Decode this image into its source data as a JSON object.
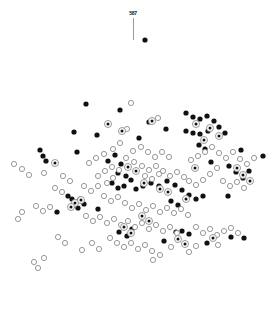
{
  "figure": {
    "width": 272,
    "height": 314,
    "background": "#ffffff"
  },
  "annotation": {
    "label": "587",
    "label_x": 133,
    "label_y": 10,
    "leader_x": 133,
    "leader_y_top": 18,
    "leader_y_bottom": 40,
    "leader_color": "#9a9a9a"
  },
  "markers": {
    "filled_color": "#111111",
    "hollow_stroke": "#8d8d8d",
    "hollow_fill": "#ffffff",
    "bullseye_stroke": "#8d8d8d",
    "bullseye_core": "#111111",
    "radius": 2.6
  },
  "chart_data": {
    "type": "scatter",
    "title": "",
    "subtitle": "",
    "xlabel": "",
    "ylabel": "",
    "xlim": [
      0,
      272
    ],
    "ylim": [
      314,
      0
    ],
    "grid": false,
    "axes_visible": false,
    "legend": null,
    "legend_position": "none",
    "annotations": [
      {
        "text": "587",
        "x": 133,
        "y": 10,
        "points_to_x": 145,
        "points_to_y": 40
      }
    ],
    "series": [
      {
        "name": "filled",
        "marker": "filled-circle",
        "color": "#111111",
        "points": [
          [
            145,
            40
          ],
          [
            86,
            104
          ],
          [
            120,
            110
          ],
          [
            149,
            122
          ],
          [
            74,
            132
          ],
          [
            97,
            135
          ],
          [
            139,
            138
          ],
          [
            186,
            113
          ],
          [
            193,
            117
          ],
          [
            200,
            119
          ],
          [
            207,
            116
          ],
          [
            214,
            121
          ],
          [
            219,
            127
          ],
          [
            208,
            131
          ],
          [
            200,
            134
          ],
          [
            193,
            133
          ],
          [
            186,
            131
          ],
          [
            225,
            133
          ],
          [
            199,
            145
          ],
          [
            205,
            149
          ],
          [
            241,
            150
          ],
          [
            211,
            162
          ],
          [
            77,
            152
          ],
          [
            40,
            150
          ],
          [
            43,
            156
          ],
          [
            46,
            161
          ],
          [
            166,
            129
          ],
          [
            115,
            155
          ],
          [
            108,
            161
          ],
          [
            121,
            164
          ],
          [
            118,
            173
          ],
          [
            126,
            176
          ],
          [
            131,
            180
          ],
          [
            124,
            186
          ],
          [
            118,
            188
          ],
          [
            112,
            183
          ],
          [
            136,
            189
          ],
          [
            143,
            186
          ],
          [
            151,
            183
          ],
          [
            159,
            186
          ],
          [
            167,
            181
          ],
          [
            175,
            185
          ],
          [
            182,
            190
          ],
          [
            189,
            195
          ],
          [
            196,
            199
          ],
          [
            203,
            196
          ],
          [
            68,
            196
          ],
          [
            72,
            199
          ],
          [
            76,
            202
          ],
          [
            80,
            199
          ],
          [
            84,
            204
          ],
          [
            78,
            208
          ],
          [
            72,
            206
          ],
          [
            98,
            209
          ],
          [
            57,
            212
          ],
          [
            229,
            166
          ],
          [
            236,
            172
          ],
          [
            243,
            178
          ],
          [
            249,
            171
          ],
          [
            263,
            156
          ],
          [
            228,
            196
          ],
          [
            171,
            201
          ],
          [
            178,
            205
          ],
          [
            119,
            232
          ],
          [
            132,
            229
          ],
          [
            127,
            236
          ],
          [
            164,
            241
          ],
          [
            176,
            232
          ],
          [
            182,
            231
          ],
          [
            189,
            234
          ],
          [
            231,
            237
          ],
          [
            244,
            238
          ],
          [
            207,
            243
          ]
        ]
      },
      {
        "name": "hollow",
        "marker": "open-circle",
        "color": "#8d8d8d",
        "points": [
          [
            131,
            103
          ],
          [
            158,
            118
          ],
          [
            127,
            129
          ],
          [
            120,
            143
          ],
          [
            113,
            149
          ],
          [
            133,
            151
          ],
          [
            141,
            147
          ],
          [
            148,
            152
          ],
          [
            155,
            157
          ],
          [
            162,
            152
          ],
          [
            169,
            157
          ],
          [
            104,
            154
          ],
          [
            96,
            158
          ],
          [
            89,
            163
          ],
          [
            126,
            158
          ],
          [
            134,
            162
          ],
          [
            142,
            166
          ],
          [
            149,
            170
          ],
          [
            156,
            166
          ],
          [
            163,
            171
          ],
          [
            170,
            176
          ],
          [
            177,
            172
          ],
          [
            184,
            177
          ],
          [
            112,
            167
          ],
          [
            105,
            171
          ],
          [
            98,
            176
          ],
          [
            119,
            170
          ],
          [
            113,
            178
          ],
          [
            107,
            183
          ],
          [
            145,
            176
          ],
          [
            152,
            179
          ],
          [
            159,
            174
          ],
          [
            191,
            160
          ],
          [
            198,
            156
          ],
          [
            205,
            152
          ],
          [
            212,
            147
          ],
          [
            219,
            153
          ],
          [
            226,
            158
          ],
          [
            233,
            152
          ],
          [
            240,
            159
          ],
          [
            247,
            164
          ],
          [
            254,
            158
          ],
          [
            217,
            168
          ],
          [
            210,
            174
          ],
          [
            203,
            180
          ],
          [
            196,
            185
          ],
          [
            189,
            181
          ],
          [
            223,
            181
          ],
          [
            230,
            186
          ],
          [
            237,
            182
          ],
          [
            244,
            188
          ],
          [
            14,
            164
          ],
          [
            22,
            169
          ],
          [
            29,
            175
          ],
          [
            44,
            173
          ],
          [
            63,
            176
          ],
          [
            70,
            181
          ],
          [
            84,
            186
          ],
          [
            91,
            191
          ],
          [
            98,
            186
          ],
          [
            55,
            188
          ],
          [
            62,
            192
          ],
          [
            104,
            196
          ],
          [
            111,
            201
          ],
          [
            118,
            197
          ],
          [
            125,
            203
          ],
          [
            132,
            208
          ],
          [
            139,
            204
          ],
          [
            146,
            210
          ],
          [
            153,
            206
          ],
          [
            160,
            212
          ],
          [
            167,
            208
          ],
          [
            174,
            213
          ],
          [
            181,
            209
          ],
          [
            188,
            215
          ],
          [
            22,
            212
          ],
          [
            36,
            206
          ],
          [
            43,
            211
          ],
          [
            50,
            207
          ],
          [
            18,
            219
          ],
          [
            86,
            216
          ],
          [
            93,
            221
          ],
          [
            100,
            217
          ],
          [
            107,
            223
          ],
          [
            114,
            219
          ],
          [
            121,
            225
          ],
          [
            128,
            221
          ],
          [
            135,
            227
          ],
          [
            142,
            223
          ],
          [
            149,
            229
          ],
          [
            156,
            225
          ],
          [
            163,
            231
          ],
          [
            170,
            227
          ],
          [
            177,
            233
          ],
          [
            196,
            227
          ],
          [
            203,
            233
          ],
          [
            210,
            229
          ],
          [
            217,
            235
          ],
          [
            224,
            231
          ],
          [
            231,
            228
          ],
          [
            238,
            233
          ],
          [
            110,
            238
          ],
          [
            117,
            243
          ],
          [
            124,
            247
          ],
          [
            131,
            243
          ],
          [
            138,
            249
          ],
          [
            145,
            245
          ],
          [
            152,
            251
          ],
          [
            92,
            243
          ],
          [
            99,
            249
          ],
          [
            82,
            250
          ],
          [
            34,
            262
          ],
          [
            38,
            268
          ],
          [
            44,
            258
          ],
          [
            171,
            247
          ],
          [
            196,
            246
          ],
          [
            189,
            252
          ],
          [
            160,
            255
          ],
          [
            153,
            260
          ],
          [
            218,
            245
          ],
          [
            58,
            237
          ],
          [
            65,
            243
          ]
        ]
      },
      {
        "name": "bullseye",
        "marker": "circle-with-center-dot",
        "color": "#8d8d8d",
        "points": [
          [
            108,
            124
          ],
          [
            122,
            131
          ],
          [
            152,
            121
          ],
          [
            196,
            124
          ],
          [
            210,
            128
          ],
          [
            219,
            136
          ],
          [
            204,
            140
          ],
          [
            55,
            163
          ],
          [
            128,
            167
          ],
          [
            136,
            171
          ],
          [
            144,
            183
          ],
          [
            160,
            189
          ],
          [
            168,
            192
          ],
          [
            186,
            199
          ],
          [
            75,
            203
          ],
          [
            81,
            200
          ],
          [
            71,
            207
          ],
          [
            142,
            216
          ],
          [
            149,
            221
          ],
          [
            124,
            227
          ],
          [
            131,
            233
          ],
          [
            178,
            239
          ],
          [
            185,
            244
          ],
          [
            213,
            238
          ],
          [
            237,
            168
          ],
          [
            243,
            175
          ],
          [
            250,
            181
          ],
          [
            195,
            168
          ]
        ]
      }
    ]
  }
}
